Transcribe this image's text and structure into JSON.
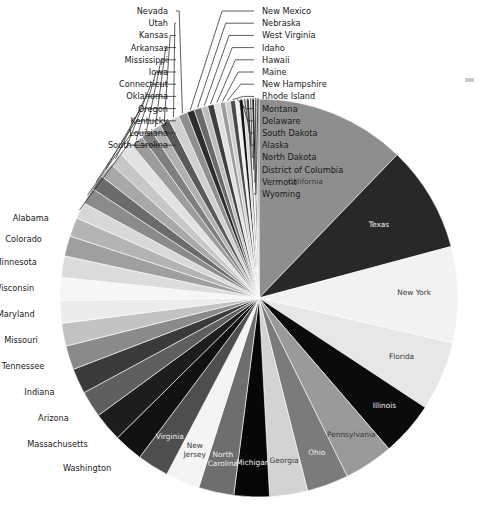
{
  "chart_data": {
    "type": "pie",
    "title": "",
    "subtitle": "",
    "xlabel": "",
    "ylabel": "",
    "legend_position": "none",
    "grid": false,
    "start_angle_deg": -90,
    "direction": "clockwise",
    "center": [
      259,
      298
    ],
    "radius": 199,
    "categories": [
      "California",
      "Texas",
      "New York",
      "Florida",
      "Illinois",
      "Pennsylvania",
      "Ohio",
      "Georgia",
      "Michigan",
      "North Carolina",
      "New Jersey",
      "Virginia",
      "Washington",
      "Massachusetts",
      "Arizona",
      "Indiana",
      "Tennessee",
      "Missouri",
      "Maryland",
      "Wisconsin",
      "Minnesota",
      "Colorado",
      "Alabama",
      "South Carolina",
      "Louisiana",
      "Kentucky",
      "Oregon",
      "Oklahoma",
      "Connecticut",
      "Iowa",
      "Mississippi",
      "Arkansas",
      "Kansas",
      "Utah",
      "Nevada",
      "New Mexico",
      "Nebraska",
      "West Virginia",
      "Idaho",
      "Hawaii",
      "Maine",
      "New Hampshire",
      "Rhode Island",
      "Montana",
      "Delaware",
      "South Dakota",
      "Alaska",
      "North Dakota",
      "District of Columbia",
      "Vermont",
      "Wyoming"
    ],
    "values": [
      11.9,
      8.4,
      7.6,
      5.5,
      4.3,
      3.9,
      3.3,
      3.0,
      2.8,
      2.8,
      2.7,
      2.5,
      2.3,
      2.3,
      2.1,
      2.0,
      1.9,
      1.8,
      1.8,
      1.8,
      1.7,
      1.6,
      1.5,
      1.3,
      1.3,
      1.2,
      1.2,
      1.1,
      1.1,
      1.0,
      0.9,
      0.8,
      0.8,
      0.8,
      0.7,
      0.6,
      0.6,
      0.5,
      0.5,
      0.5,
      0.4,
      0.4,
      0.4,
      0.3,
      0.3,
      0.25,
      0.25,
      0.2,
      0.2,
      0.2,
      0.15
    ],
    "colors": [
      "#8e8e8e",
      "#282828",
      "#f2f2f2",
      "#e7e7e7",
      "#0b0b0b",
      "#9a9a9a",
      "#7b7b7b",
      "#d3d3d3",
      "#070707",
      "#6e6e6e",
      "#f4f4f4",
      "#4e4e4e",
      "#111111",
      "#1d1d1d",
      "#5f5f5f",
      "#3a3a3a",
      "#8a8a8a",
      "#c2c2c2",
      "#ececec",
      "#f6f6f6",
      "#dcdcdc",
      "#9f9f9f",
      "#b4b4b4",
      "#d8d8d8",
      "#8b8b8b",
      "#6b6b6b",
      "#a8a8a8",
      "#c7c7c7",
      "#e2e2e2",
      "#9c9c9c",
      "#7f7f7f",
      "#b0b0b0",
      "#5a5a5a",
      "#d0d0d0",
      "#8f8f8f",
      "#2d2d2d",
      "#6a6a6a",
      "#bdbdbd",
      "#3f3f3f",
      "#e0e0e0",
      "#9b9b9b",
      "#cfcfcf",
      "#4a4a4a",
      "#efefef",
      "#101010",
      "#d6d6d6",
      "#5c5c5c",
      "#f1f1f1",
      "#1b1b1b",
      "#b8b8b8",
      "#8c8c8c"
    ],
    "inner_labels": [
      "California",
      "Texas",
      "New York",
      "Florida",
      "Illinois",
      "Pennsylvania",
      "Ohio",
      "Georgia",
      "Michigan",
      "North Carolina",
      "New Jersey",
      "Virginia"
    ],
    "outer_labels": [
      "Washington",
      "Massachusetts",
      "Arizona",
      "Indiana",
      "Tennessee",
      "Missouri",
      "Maryland",
      "Wisconsin",
      "Minnesota",
      "Colorado",
      "Alabama",
      "South Carolina",
      "Louisiana",
      "Kentucky",
      "Oregon",
      "Oklahoma",
      "Connecticut",
      "Iowa",
      "Mississippi",
      "Arkansas",
      "Kansas",
      "Utah",
      "Nevada",
      "New Mexico",
      "Nebraska",
      "West Virginia",
      "Idaho",
      "Hawaii",
      "Maine",
      "New Hampshire",
      "Rhode Island",
      "Montana",
      "Delaware",
      "South Dakota",
      "Alaska",
      "North Dakota",
      "District of Columbia",
      "Vermont",
      "Wyoming"
    ]
  },
  "labels": {
    "california": "California",
    "texas": "Texas",
    "new_york": "New York",
    "florida": "Florida",
    "illinois": "Illinois",
    "pennsylvania": "Pennsylvania",
    "ohio": "Ohio",
    "georgia": "Georgia",
    "michigan": "Michigan",
    "north_carolina": "North Carolina",
    "new_jersey": "New Jersey",
    "virginia": "Virginia",
    "washington": "Washington",
    "massachusetts": "Massachusetts",
    "arizona": "Arizona",
    "indiana": "Indiana",
    "tennessee": "Tennessee",
    "missouri": "Missouri",
    "maryland": "Maryland",
    "wisconsin": "Wisconsin",
    "minnesota": "Minnesota",
    "colorado": "Colorado",
    "alabama": "Alabama",
    "south_carolina": "South Carolina",
    "louisiana": "Louisiana",
    "kentucky": "Kentucky",
    "oregon": "Oregon",
    "oklahoma": "Oklahoma",
    "connecticut": "Connecticut",
    "iowa": "Iowa",
    "mississippi": "Mississippi",
    "arkansas": "Arkansas",
    "kansas": "Kansas",
    "utah": "Utah",
    "nevada": "Nevada",
    "new_mexico": "New Mexico",
    "nebraska": "Nebraska",
    "west_virginia": "West Virginia",
    "idaho": "Idaho",
    "hawaii": "Hawaii",
    "maine": "Maine",
    "new_hampshire": "New Hampshire",
    "rhode_island": "Rhode Island",
    "montana": "Montana",
    "delaware": "Delaware",
    "south_dakota": "South Dakota",
    "alaska": "Alaska",
    "north_dakota": "North Dakota",
    "district_of_columbia": "District of Columbia",
    "vermont": "Vermont",
    "wyoming": "Wyoming"
  }
}
